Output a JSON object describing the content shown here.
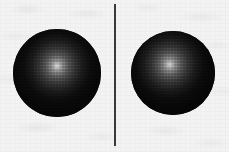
{
  "scene": {
    "width": 229,
    "height": 152,
    "background_color": "#f3f3f3",
    "description": "Two dark matte spheres on a light mottled background, separated by a thin vertical line",
    "alt_text": "Two shaded dark spheres side by side divided by a vertical line"
  },
  "objects": {
    "left_sphere": {
      "label": "left-sphere",
      "center_x": 57,
      "center_y": 73,
      "diameter": 88,
      "body_color": "#070707",
      "highlight_color": "#d8d8d8",
      "highlight_x_pct": 50,
      "highlight_y_pct": 42
    },
    "right_sphere": {
      "label": "right-sphere",
      "center_x": 173,
      "center_y": 73,
      "diameter": 84,
      "body_color": "#060606",
      "highlight_color": "#d2d2d2",
      "highlight_x_pct": 46,
      "highlight_y_pct": 40
    },
    "divider": {
      "label": "vertical-divider-line",
      "x": 115,
      "top": 4,
      "bottom": 146,
      "thickness": 2,
      "color": "#3a3a3a"
    }
  }
}
